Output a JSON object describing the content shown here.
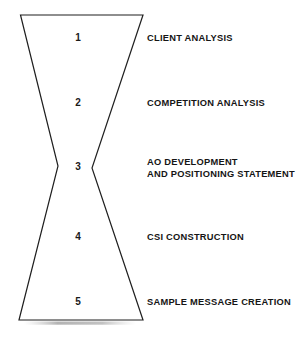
{
  "diagram": {
    "type": "hourglass-process-diagram",
    "shape": {
      "name": "hourglass",
      "stroke_color": "#1f1f1f",
      "fill_color": "#ffffff",
      "stroke_width": 1.2
    },
    "background_color": "#ffffff",
    "stages": [
      {
        "number": "1",
        "label": "CLIENT ANALYSIS"
      },
      {
        "number": "2",
        "label": "COMPETITION ANALYSIS"
      },
      {
        "number": "3",
        "label": "AO DEVELOPMENT\nAND POSITIONING STATEMENT"
      },
      {
        "number": "4",
        "label": "CSI CONSTRUCTION"
      },
      {
        "number": "5",
        "label": "SAMPLE MESSAGE CREATION"
      }
    ]
  }
}
